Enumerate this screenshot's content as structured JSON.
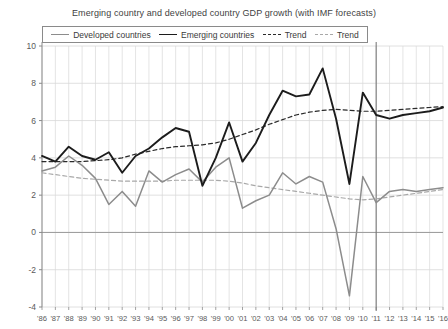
{
  "chart_data": {
    "type": "line",
    "title": "Emerging country and developed country GDP growth (with IMF forecasts)",
    "xlabel": "",
    "ylabel": "",
    "ylim": [
      -4,
      10
    ],
    "xlim": [
      1986,
      2016
    ],
    "yticks": [
      -4,
      -2,
      0,
      2,
      4,
      6,
      8,
      10
    ],
    "ytick_labels": [
      "-4",
      "-2",
      "0",
      "2",
      "4",
      "6",
      "8",
      "10"
    ],
    "grid": true,
    "legend_position": "top",
    "x": [
      1986,
      1987,
      1988,
      1989,
      1990,
      1991,
      1992,
      1993,
      1994,
      1995,
      1996,
      1997,
      1998,
      1999,
      2000,
      2001,
      2002,
      2003,
      2004,
      2005,
      2006,
      2007,
      2008,
      2009,
      2010,
      2011,
      2012,
      2013,
      2014,
      2015,
      2016
    ],
    "xtick_labels": [
      "'86",
      "'87",
      "'88",
      "'89",
      "'90",
      "'91",
      "'92",
      "'93",
      "'94",
      "'95",
      "'96",
      "'97",
      "'98",
      "'99",
      "'00",
      "'01",
      "'02",
      "'03",
      "'04",
      "'05",
      "'06",
      "'07",
      "'08",
      "'09",
      "'10",
      "'11",
      "'12",
      "'13",
      "'14",
      "'15",
      "'16"
    ],
    "forecast_divider_x": 2011,
    "series": [
      {
        "name": "Developed countries",
        "style": "solid",
        "color": "#8c8c8c",
        "values": [
          3.3,
          3.5,
          4.1,
          3.6,
          2.9,
          1.5,
          2.2,
          1.4,
          3.3,
          2.7,
          3.1,
          3.4,
          2.7,
          3.5,
          4.0,
          1.3,
          1.7,
          2.0,
          3.2,
          2.6,
          3.0,
          2.7,
          0.2,
          -3.4,
          3.0,
          1.6,
          2.2,
          2.3,
          2.2,
          2.3,
          2.4
        ]
      },
      {
        "name": "Emerging countries",
        "style": "solid",
        "color": "#1c1c1c",
        "values": [
          4.1,
          3.8,
          4.6,
          4.1,
          3.9,
          4.3,
          3.2,
          4.1,
          4.5,
          5.1,
          5.6,
          5.4,
          2.5,
          4.0,
          5.9,
          3.8,
          4.8,
          6.3,
          7.6,
          7.3,
          7.4,
          8.8,
          6.1,
          2.6,
          7.5,
          6.3,
          6.1,
          6.3,
          6.4,
          6.5,
          6.7
        ]
      },
      {
        "name": "Trend",
        "style": "dashed",
        "color": "#2a2a2a",
        "values": [
          3.8,
          3.8,
          3.8,
          3.8,
          3.85,
          3.9,
          4.0,
          4.2,
          4.35,
          4.5,
          4.6,
          4.65,
          4.7,
          4.8,
          5.0,
          5.25,
          5.5,
          5.8,
          6.05,
          6.3,
          6.45,
          6.55,
          6.6,
          6.55,
          6.5,
          6.5,
          6.55,
          6.6,
          6.65,
          6.7,
          6.75
        ]
      },
      {
        "name": "Trend",
        "style": "dashed",
        "color": "#a8a8a8",
        "values": [
          3.2,
          3.1,
          3.0,
          2.9,
          2.85,
          2.8,
          2.75,
          2.75,
          2.75,
          2.75,
          2.8,
          2.8,
          2.8,
          2.8,
          2.75,
          2.65,
          2.5,
          2.4,
          2.3,
          2.2,
          2.1,
          2.0,
          1.9,
          1.8,
          1.75,
          1.8,
          1.9,
          2.0,
          2.1,
          2.2,
          2.3
        ]
      }
    ],
    "legend": [
      {
        "label": "Developed countries",
        "color": "#8c8c8c",
        "style": "solid"
      },
      {
        "label": "Emerging countries",
        "color": "#1c1c1c",
        "style": "solid"
      },
      {
        "label": "Trend",
        "color": "#2a2a2a",
        "style": "dashed"
      },
      {
        "label": "Trend",
        "color": "#a8a8a8",
        "style": "dashed"
      }
    ],
    "colors": {
      "developed": "#8c8c8c",
      "emerging": "#1c1c1c",
      "trend_emerging": "#2a2a2a",
      "trend_developed": "#a8a8a8",
      "grid": "#d8d8d8",
      "axis": "#8a8a8a",
      "zero_line": "#9a9a9a",
      "background": "#ffffff"
    }
  }
}
